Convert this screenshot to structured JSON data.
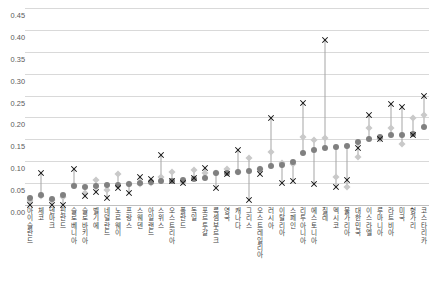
{
  "chart_data": {
    "type": "scatter",
    "title": "",
    "xlabel": "",
    "ylabel": "",
    "ylim": [
      0.0,
      0.45
    ],
    "ytick_labels": [
      "0.45",
      "0.40",
      "0.35",
      "0.30",
      "0.25",
      "0.20",
      "0.15",
      "0.10",
      "0.05",
      "0.00"
    ],
    "ytick_values": [
      0.45,
      0.4,
      0.35,
      0.3,
      0.25,
      0.2,
      0.15,
      0.1,
      0.05,
      0.0
    ],
    "grid": true,
    "legend_position": "none",
    "categories": [
      "아이슬란드",
      "체코",
      "덴마크",
      "핀란드",
      "슬로베니아",
      "슬로바키아",
      "벨기에",
      "네덜란드",
      "노르웨이",
      "프랑스",
      "스웨덴",
      "아일랜드",
      "스위스",
      "오스트리아",
      "폴란드",
      "독일",
      "포르투갈",
      "룩셈부르크",
      "영국",
      "캐나다",
      "그리스",
      "오스트레일리아",
      "러시아",
      "이탈리아",
      "스페인",
      "리투아니아",
      "에스토니아",
      "칠레",
      "멕시코",
      "불가리아",
      "대한민국",
      "이스라엘",
      "루마니아",
      "라트비아",
      "미국",
      "헝가리",
      "코스타리카"
    ],
    "series": [
      {
        "name": "series-diamond",
        "marker": "diamond",
        "color": "#c9c9c9",
        "values": [
          0.01,
          0.02,
          0.012,
          0.018,
          0.045,
          0.028,
          0.058,
          0.035,
          0.07,
          0.047,
          0.048,
          0.05,
          0.063,
          0.076,
          0.052,
          0.08,
          0.073,
          0.072,
          0.083,
          0.075,
          0.107,
          0.082,
          0.122,
          0.095,
          0.093,
          0.155,
          0.148,
          0.152,
          0.065,
          0.042,
          0.11,
          0.175,
          0.15,
          0.175,
          0.14,
          0.198,
          0.205
        ]
      },
      {
        "name": "series-circle",
        "marker": "circle",
        "color": "#808080",
        "values": [
          0.017,
          0.023,
          0.014,
          0.023,
          0.043,
          0.042,
          0.044,
          0.045,
          0.046,
          0.049,
          0.05,
          0.053,
          0.055,
          0.056,
          0.058,
          0.06,
          0.062,
          0.072,
          0.073,
          0.075,
          0.078,
          0.082,
          0.088,
          0.092,
          0.098,
          0.118,
          0.125,
          0.13,
          0.133,
          0.135,
          0.145,
          0.15,
          0.155,
          0.16,
          0.16,
          0.162,
          0.178
        ]
      },
      {
        "name": "series-cross",
        "marker": "cross",
        "color": "#1a1a1a",
        "values": [
          0.0,
          0.072,
          0.0,
          0.0,
          0.082,
          0.02,
          0.03,
          0.017,
          0.038,
          0.027,
          0.065,
          0.06,
          0.115,
          0.055,
          0.05,
          0.062,
          0.085,
          0.04,
          0.07,
          0.125,
          0.012,
          0.07,
          0.198,
          0.05,
          0.055,
          0.232,
          0.048,
          0.378,
          0.042,
          0.058,
          0.13,
          0.205,
          0.15,
          0.23,
          0.225,
          0.16,
          0.25
        ]
      }
    ]
  },
  "footnote": {
    "text": ""
  }
}
